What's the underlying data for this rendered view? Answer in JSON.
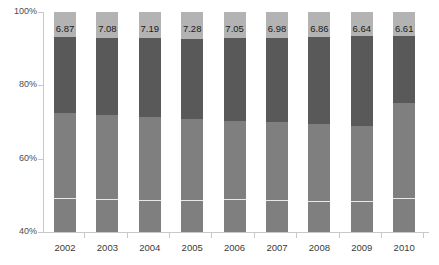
{
  "chart_data": {
    "type": "bar",
    "subtype": "100% stacked column",
    "title": "",
    "xlabel": "",
    "ylabel": "",
    "ylim": [
      40,
      100
    ],
    "y_tick_labels": [
      "40%",
      "60%",
      "80%",
      "100%"
    ],
    "y_ticks": [
      40,
      60,
      80,
      100
    ],
    "grid": false,
    "legend": "none",
    "categories": [
      "2002",
      "2003",
      "2004",
      "2005",
      "2006",
      "2007",
      "2008",
      "2009",
      "2010"
    ],
    "series": [
      {
        "name": "bottom-lower",
        "color": "#7f7f7f",
        "values": [
          9.3,
          9.0,
          8.8,
          9.1,
          8.9,
          8.6,
          8.4,
          8.5,
          9.2
        ]
      },
      {
        "name": "bottom-upper",
        "color": "#7f7f7f",
        "values": [
          23.2,
          22.9,
          22.6,
          21.8,
          21.5,
          21.3,
          21.0,
          20.4,
          25.9
        ]
      },
      {
        "name": "middle",
        "color": "#595959",
        "values": [
          20.63,
          20.93,
          21.41,
          21.81,
          22.55,
          23.11,
          23.7,
          24.46,
          18.3
        ]
      },
      {
        "name": "top",
        "color": "#b3b3b3",
        "values": [
          6.87,
          7.08,
          7.19,
          7.28,
          7.05,
          6.98,
          6.86,
          6.64,
          6.61
        ]
      }
    ],
    "data_labels": [
      "6.87",
      "7.08",
      "7.19",
      "7.28",
      "7.05",
      "6.98",
      "6.86",
      "6.64",
      "6.61"
    ],
    "segment_boundaries_percent": {
      "top_of_middle": [
        93.13,
        92.92,
        92.81,
        92.72,
        92.95,
        93.02,
        93.14,
        93.36,
        93.39
      ],
      "bottom_of_middle": [
        72.5,
        71.99,
        71.4,
        70.91,
        70.4,
        69.91,
        69.44,
        68.9,
        75.09
      ],
      "inner_divider": [
        49.3,
        49.1,
        48.8,
        48.8,
        48.9,
        48.6,
        48.4,
        48.5,
        49.2
      ]
    },
    "colors": {
      "top": "#b3b3b3",
      "middle": "#595959",
      "bottom": "#7f7f7f",
      "divider": "#e8e8e8",
      "axis": "#c8c8c8",
      "label_text": "#1a1a1a",
      "tick_text": "#4d4d4d"
    }
  }
}
